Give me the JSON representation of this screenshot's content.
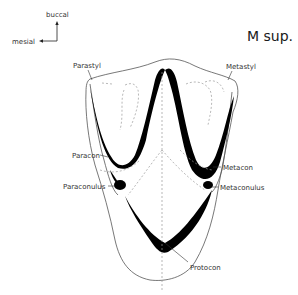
{
  "title": "M sup.",
  "orientation": {
    "vertical_label": "buccal",
    "horizontal_label": "mesial"
  },
  "labels": {
    "parastyl": "Parastyl",
    "metastyl": "Metastyl",
    "paracon": "Paracon",
    "metacon": "Metacon",
    "paraconulus": "Paraconulus",
    "metaconulus": "Metaconulus",
    "protocon": "Protocon"
  }
}
